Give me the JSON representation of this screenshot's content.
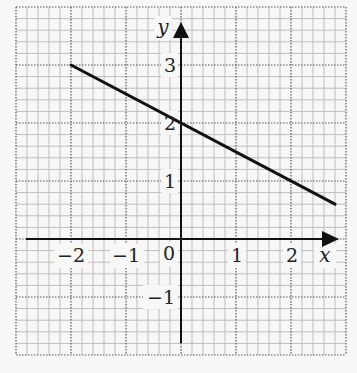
{
  "chart_data": {
    "type": "line",
    "title": "",
    "xlabel": "x",
    "ylabel": "y",
    "xlim": [
      -3,
      3
    ],
    "ylim": [
      -2,
      4
    ],
    "grid": true,
    "minor_grid_step": 0.2,
    "major_grid_step": 1,
    "x_ticks": [
      {
        "value": -2,
        "label": "−2"
      },
      {
        "value": -1,
        "label": "−1"
      },
      {
        "value": 1,
        "label": "1"
      },
      {
        "value": 2,
        "label": "2"
      }
    ],
    "y_ticks": [
      {
        "value": 3,
        "label": "3"
      },
      {
        "value": 2,
        "label": "2"
      },
      {
        "value": 1,
        "label": "1"
      },
      {
        "value": -1,
        "label": "−1"
      }
    ],
    "origin_label": "0",
    "series": [
      {
        "name": "line",
        "equation": "y = -0.5x + 2",
        "x": [
          -2,
          0,
          2.8
        ],
        "y": [
          3,
          2,
          0.6
        ],
        "color": "#111111"
      }
    ]
  },
  "labels": {
    "x_axis": "x",
    "y_axis": "y",
    "origin": "0",
    "xt_m2": "−2",
    "xt_m1": "−1",
    "xt_1": "1",
    "xt_2": "2",
    "yt_3": "3",
    "yt_2": "2",
    "yt_1": "1",
    "yt_m1": "−1"
  },
  "colors": {
    "background": "#f7f7f7",
    "minor_grid": "#bdbdbd",
    "major_grid": "#555555",
    "axis": "#111111",
    "line": "#111111"
  }
}
